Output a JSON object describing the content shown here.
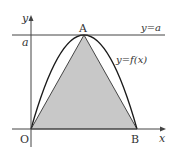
{
  "figure": {
    "type": "function-graph",
    "labels": {
      "y_axis": "y",
      "x_axis": "x",
      "a_tick": "a",
      "point_A": "A",
      "point_O": "O",
      "point_B": "B",
      "line_label": "y=a",
      "curve_label": "y=f(x)"
    },
    "points": {
      "O": [
        31,
        129
      ],
      "A": [
        84,
        35
      ],
      "B": [
        137,
        129
      ]
    },
    "colors": {
      "shade": "#c8c8c8",
      "stroke": "#222222",
      "axis": "#444444",
      "text": "#333333"
    }
  }
}
